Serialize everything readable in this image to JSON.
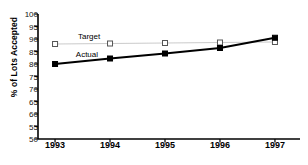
{
  "chart_data": {
    "type": "line",
    "title": "",
    "xlabel": "",
    "ylabel": "% of Lots Accepted",
    "categories": [
      "1993",
      "1994",
      "1995",
      "1996",
      "1997"
    ],
    "x": [
      1993,
      1994,
      1995,
      1996,
      1997
    ],
    "ylim": [
      50,
      100
    ],
    "yticks": [
      50,
      55,
      60,
      65,
      70,
      75,
      80,
      85,
      90,
      95,
      100
    ],
    "grid": false,
    "legend_position": "inline-annotation",
    "series": [
      {
        "name": "Target",
        "values": [
          88.0,
          88.2,
          88.4,
          88.6,
          88.8
        ],
        "color": "#bdbdbd",
        "marker": "open-square",
        "marker_edge_color": "#555555",
        "marker_face_color": "#ffffff",
        "line_width": 0.8
      },
      {
        "name": "Actual",
        "values": [
          80.0,
          82.2,
          84.2,
          86.4,
          90.5
        ],
        "color": "#000000",
        "marker": "filled-square",
        "marker_edge_color": "#000000",
        "marker_face_color": "#000000",
        "line_width": 2.2
      }
    ],
    "annotations": [
      {
        "text": "Target",
        "x": 1993.62,
        "y": 91.2
      },
      {
        "text": "Actual",
        "x": 1993.58,
        "y": 84.2
      }
    ]
  },
  "axes": {
    "axis_color": "#000000",
    "background": "#ffffff"
  }
}
